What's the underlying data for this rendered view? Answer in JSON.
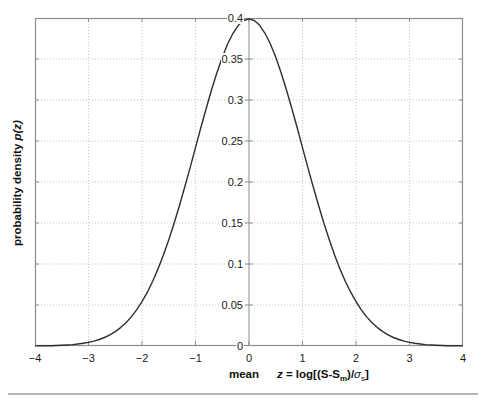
{
  "figure": {
    "ylabel_text": "probability density ",
    "ylabel_math": "p(z)",
    "xlabel_mean": "mean",
    "formula": {
      "z": "z",
      "part1": " = log[(S-S",
      "sub_m": "m",
      "part2": ")/",
      "sigma": "σ",
      "sub_s": "s",
      "part3": "]"
    }
  },
  "colors": {
    "frame_axis": "#8c8c8c",
    "grid": "#c6c6c6",
    "curve": "#2e2e2e",
    "text": "#1a1a1a",
    "page_rule": "#b4b4b4"
  },
  "chart_data": {
    "type": "line",
    "title": "",
    "xlabel": "mean    z = log[(S-Sm)/σs]",
    "ylabel": "probability density p(z)",
    "xlim": [
      -4,
      4
    ],
    "ylim": [
      0,
      0.4
    ],
    "xticks": [
      -4,
      -3,
      -2,
      -1,
      0,
      1,
      2,
      3,
      4
    ],
    "xtick_labels": [
      "−4",
      "−3",
      "−2",
      "−1",
      "0",
      "1",
      "2",
      "3",
      "4"
    ],
    "yticks": [
      0,
      0.05,
      0.1,
      0.15,
      0.2,
      0.25,
      0.3,
      0.35,
      0.4
    ],
    "ytick_labels": [
      "0",
      "0.05",
      "0.1",
      "0.15",
      "0.2",
      "0.25",
      "0.3",
      "0.35",
      "0.4"
    ],
    "grid": "dotted",
    "legend": "none",
    "y_axis_location": "origin",
    "series": [
      {
        "name": "standard normal pdf",
        "x": [
          -4.0,
          -3.9,
          -3.8,
          -3.7,
          -3.6,
          -3.5,
          -3.4,
          -3.3,
          -3.2,
          -3.1,
          -3.0,
          -2.9,
          -2.8,
          -2.7,
          -2.6,
          -2.5,
          -2.4,
          -2.3,
          -2.2,
          -2.1,
          -2.0,
          -1.9,
          -1.8,
          -1.7,
          -1.6,
          -1.5,
          -1.4,
          -1.3,
          -1.2,
          -1.1,
          -1.0,
          -0.9,
          -0.8,
          -0.7,
          -0.6,
          -0.5,
          -0.4,
          -0.3,
          -0.2,
          -0.1,
          0.0,
          0.1,
          0.2,
          0.3,
          0.4,
          0.5,
          0.6,
          0.7,
          0.8,
          0.9,
          1.0,
          1.1,
          1.2,
          1.3,
          1.4,
          1.5,
          1.6,
          1.7,
          1.8,
          1.9,
          2.0,
          2.1,
          2.2,
          2.3,
          2.4,
          2.5,
          2.6,
          2.7,
          2.8,
          2.9,
          3.0,
          3.1,
          3.2,
          3.3,
          3.4,
          3.5,
          3.6,
          3.7,
          3.8,
          3.9,
          4.0
        ],
        "y": [
          0.00013,
          0.0002,
          0.00029,
          0.00042,
          0.00061,
          0.00087,
          0.00123,
          0.00172,
          0.00238,
          0.00327,
          0.00443,
          0.00595,
          0.00792,
          0.01042,
          0.01358,
          0.01753,
          0.02239,
          0.02833,
          0.03547,
          0.04398,
          0.05399,
          0.06562,
          0.07895,
          0.09405,
          0.11092,
          0.12952,
          0.14973,
          0.17137,
          0.19419,
          0.21785,
          0.24197,
          0.26609,
          0.28969,
          0.31225,
          0.33322,
          0.35207,
          0.36827,
          0.38139,
          0.39104,
          0.39695,
          0.39894,
          0.39695,
          0.39104,
          0.38139,
          0.36827,
          0.35207,
          0.33322,
          0.31225,
          0.28969,
          0.26609,
          0.24197,
          0.21785,
          0.19419,
          0.17137,
          0.14973,
          0.12952,
          0.11092,
          0.09405,
          0.07895,
          0.06562,
          0.05399,
          0.04398,
          0.03547,
          0.02833,
          0.02239,
          0.01753,
          0.01358,
          0.01042,
          0.00792,
          0.00595,
          0.00443,
          0.00327,
          0.00238,
          0.00172,
          0.00123,
          0.00087,
          0.00061,
          0.00042,
          0.00029,
          0.0002,
          0.00013
        ]
      }
    ]
  }
}
